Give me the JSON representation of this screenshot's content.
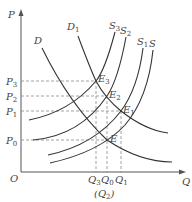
{
  "diagram": {
    "type": "supply-demand",
    "axes": {
      "y_label": "P",
      "x_label": "Q",
      "origin_label": "O"
    },
    "price_levels": [
      {
        "id": "P3",
        "base": "P",
        "sub": "3"
      },
      {
        "id": "P2",
        "base": "P",
        "sub": "2"
      },
      {
        "id": "P1",
        "base": "P",
        "sub": "1"
      },
      {
        "id": "P0",
        "base": "P",
        "sub": "0"
      }
    ],
    "quantity_levels": [
      {
        "id": "Q3",
        "base": "Q",
        "sub": "3"
      },
      {
        "id": "Q0",
        "base": "Q",
        "sub": "0"
      },
      {
        "id": "Q1",
        "base": "Q",
        "sub": "1"
      }
    ],
    "quantity_note": {
      "open": "(",
      "base": "Q",
      "sub": "2",
      "close": ")"
    },
    "demand_curves": [
      {
        "id": "D",
        "base": "D",
        "sub": ""
      },
      {
        "id": "D1",
        "base": "D",
        "sub": "1"
      }
    ],
    "supply_curves": [
      {
        "id": "S3",
        "base": "S",
        "sub": "3"
      },
      {
        "id": "S2",
        "base": "S",
        "sub": "2"
      },
      {
        "id": "S1",
        "base": "S",
        "sub": "1"
      },
      {
        "id": "S",
        "base": "S",
        "sub": ""
      }
    ],
    "equilibria": [
      {
        "id": "E3",
        "base": "E",
        "sub": "3"
      },
      {
        "id": "E2",
        "base": "E",
        "sub": "2"
      },
      {
        "id": "E1",
        "base": "E",
        "sub": "1"
      },
      {
        "id": "E",
        "base": "E",
        "sub": ""
      }
    ],
    "colors": {
      "curve": "#333333",
      "axis": "#555555",
      "dashed_guide": "#8a8a8a",
      "label": "#444444"
    }
  }
}
